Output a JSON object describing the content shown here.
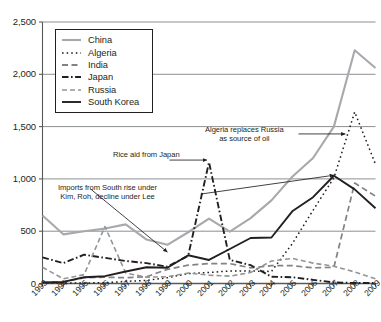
{
  "chart_data": {
    "type": "line",
    "title": "",
    "subtitle": "",
    "xlabel": "",
    "ylabel": "",
    "grid": true,
    "legend_position": "inside-top-left",
    "ylim": [
      0,
      2500
    ],
    "yticks": [
      0,
      500,
      1000,
      1500,
      2000,
      2500
    ],
    "ytick_labels": [
      "0",
      "500",
      "1,000",
      "1,500",
      "2,000",
      "2,500"
    ],
    "x": [
      1993,
      1994,
      1995,
      1996,
      1997,
      1998,
      1999,
      2000,
      2001,
      2002,
      2003,
      2004,
      2005,
      2006,
      2007,
      2008,
      2009
    ],
    "xtick_labels": [
      "1993",
      "1994",
      "1995",
      "1996",
      "1997",
      "1998",
      "1999",
      "2000",
      "2001",
      "2002",
      "2003",
      "2004",
      "2005",
      "2006",
      "2007",
      "2008",
      "2009"
    ],
    "series": [
      {
        "name": "China",
        "color": "#a7a9ac",
        "style": "solid",
        "width": 2.1,
        "values": [
          650,
          470,
          500,
          525,
          565,
          420,
          370,
          490,
          620,
          495,
          625,
          795,
          1020,
          1200,
          1500,
          2230,
          2060
        ]
      },
      {
        "name": "Algeria",
        "color": "#231f20",
        "style": "dotted",
        "width": 1.5,
        "values": [
          5,
          5,
          5,
          8,
          20,
          30,
          55,
          95,
          105,
          120,
          120,
          115,
          380,
          700,
          1010,
          1640,
          1140
        ]
      },
      {
        "name": "India",
        "color": "#808285",
        "style": "dashed-long",
        "width": 1.7,
        "values": [
          10,
          15,
          55,
          60,
          55,
          65,
          135,
          175,
          190,
          190,
          150,
          170,
          170,
          150,
          155,
          960,
          835
        ]
      },
      {
        "name": "Japan",
        "color": "#231f20",
        "style": "dashed-japan",
        "width": 1.9,
        "values": [
          250,
          195,
          275,
          245,
          215,
          195,
          160,
          265,
          1160,
          225,
          175,
          65,
          60,
          35,
          10,
          5,
          5
        ]
      },
      {
        "name": "Russia",
        "color": "#939598",
        "style": "dashed-med",
        "width": 1.6,
        "values": [
          155,
          45,
          85,
          545,
          100,
          60,
          65,
          100,
          80,
          70,
          105,
          215,
          240,
          195,
          165,
          110,
          45
        ]
      },
      {
        "name": "South Korea",
        "color": "#231f20",
        "style": "solid",
        "width": 1.9,
        "values": [
          10,
          15,
          60,
          70,
          115,
          155,
          150,
          270,
          225,
          330,
          435,
          440,
          690,
          825,
          1030,
          900,
          720
        ]
      }
    ],
    "annotations": [
      {
        "id": "algeria-note",
        "text_lines": [
          "Algeria replaces Russia",
          "as source of oil"
        ],
        "arrow_from_year": 2005.3,
        "arrow_from_value": 1430,
        "arrow_to_year": 2007.55,
        "arrow_to_value": 1430
      },
      {
        "id": "japan-note",
        "text_lines": [
          "Rice aid from Japan"
        ],
        "arrow_from_year": 1999.1,
        "arrow_from_value": 1180,
        "arrow_to_year": 2000.9,
        "arrow_to_value": 1180
      },
      {
        "id": "korea-note",
        "text_lines": [
          "Imports from South rise under",
          "Kim, Roh, decline under Lee"
        ],
        "arrow_from_year": 1995.3,
        "arrow_from_value": 905,
        "arrow_to_year": 1999.0,
        "arrow_to_value": 300,
        "arrow2_from_year": 2000.6,
        "arrow2_from_value": 855,
        "arrow2_to_year": 2007.0,
        "arrow2_to_value": 1035
      }
    ]
  },
  "legend": {
    "items": [
      {
        "label": "China"
      },
      {
        "label": "Algeria"
      },
      {
        "label": "India"
      },
      {
        "label": "Japan"
      },
      {
        "label": "Russia"
      },
      {
        "label": "South Korea"
      }
    ]
  }
}
